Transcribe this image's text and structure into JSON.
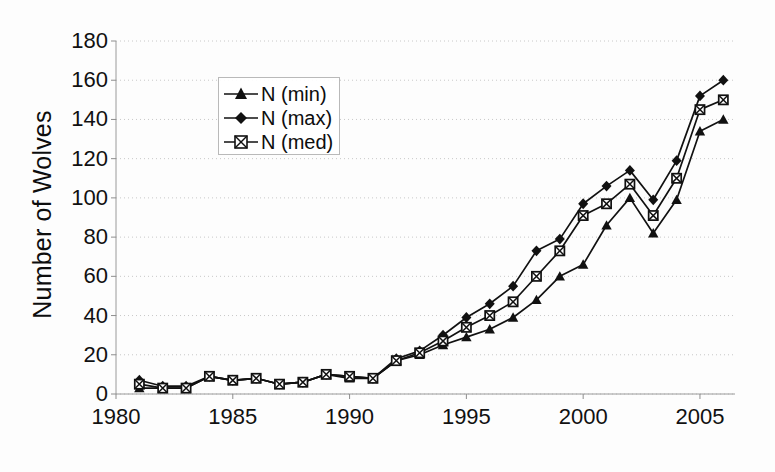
{
  "chart_data": {
    "type": "line",
    "title": "",
    "xlabel": "",
    "ylabel": "Number of Wolves",
    "xlim": [
      1980,
      2006.5
    ],
    "ylim": [
      0,
      180
    ],
    "ytick_labels": [
      "0",
      "20",
      "40",
      "60",
      "80",
      "100",
      "120",
      "140",
      "160",
      "180"
    ],
    "ytick_values": [
      0,
      20,
      40,
      60,
      80,
      100,
      120,
      140,
      160,
      180
    ],
    "xtick_labels": [
      "1980",
      "1985",
      "1990",
      "1995",
      "2000",
      "2005"
    ],
    "xtick_values": [
      1980,
      1985,
      1990,
      1995,
      2000,
      2005
    ],
    "grid": "horizontal-dotted",
    "legend_position": "upper-left-inside",
    "x": [
      1981,
      1982,
      1983,
      1984,
      1985,
      1986,
      1987,
      1988,
      1989,
      1990,
      1991,
      1992,
      1993,
      1994,
      1995,
      1996,
      1997,
      1998,
      1999,
      2000,
      2001,
      2002,
      2003,
      2004,
      2005,
      2006
    ],
    "series": [
      {
        "name": "N (min)",
        "marker": "triangle",
        "values": [
          3,
          3,
          3,
          9,
          7,
          8,
          5,
          6,
          10,
          8,
          8,
          17,
          20,
          25,
          29,
          33,
          39,
          48,
          60,
          66,
          86,
          100,
          82,
          99,
          134,
          140
        ]
      },
      {
        "name": "N (max)",
        "marker": "diamond",
        "values": [
          7,
          4,
          4,
          9,
          7,
          8,
          5,
          6,
          10,
          9,
          8,
          18,
          22,
          30,
          39,
          46,
          55,
          73,
          79,
          97,
          106,
          114,
          99,
          119,
          152,
          160
        ]
      },
      {
        "name": "N (med)",
        "marker": "square-x",
        "values": [
          5,
          3,
          3,
          9,
          7,
          8,
          5,
          6,
          10,
          9,
          8,
          17,
          21,
          27,
          34,
          40,
          47,
          60,
          73,
          91,
          97,
          107,
          91,
          110,
          145,
          150
        ]
      }
    ]
  },
  "legend": {
    "items": [
      {
        "label": "N (min)"
      },
      {
        "label": "N (max)"
      },
      {
        "label": "N (med)"
      }
    ]
  },
  "colors": {
    "ink": "#111111",
    "grid": "#c8c8c8",
    "background": "#fdfdfd"
  }
}
